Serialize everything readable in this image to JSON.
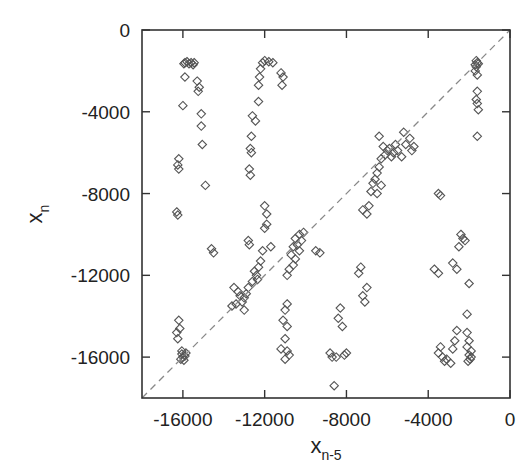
{
  "chart_data": {
    "type": "scatter",
    "title": "",
    "xlabel": "x",
    "xlabel_subscript": "n-5",
    "ylabel": "x",
    "ylabel_subscript": "n",
    "xlim": [
      -18000,
      0
    ],
    "ylim": [
      -18000,
      0
    ],
    "x_ticks": [
      -16000,
      -12000,
      -8000,
      -4000,
      0
    ],
    "x_tick_labels": [
      "-16000",
      "-12000",
      "-8000",
      "-4000",
      "0"
    ],
    "y_ticks": [
      0,
      -4000,
      -8000,
      -12000,
      -16000
    ],
    "y_tick_labels": [
      "0",
      "-4000",
      "-8000",
      "-12000",
      "-16000"
    ],
    "grid": false,
    "legend": null,
    "marker": "open-diamond",
    "reference_line": {
      "type": "diagonal",
      "style": "dashed",
      "from": [
        -18000,
        -18000
      ],
      "to": [
        0,
        0
      ]
    },
    "series": [
      {
        "name": "points",
        "points": [
          [
            -15900,
            -1600
          ],
          [
            -15800,
            -1550
          ],
          [
            -15700,
            -1650
          ],
          [
            -15600,
            -1600
          ],
          [
            -15500,
            -1700
          ],
          [
            -15950,
            -1650
          ],
          [
            -15450,
            -1600
          ],
          [
            -15900,
            -2300
          ],
          [
            -15300,
            -2500
          ],
          [
            -15200,
            -2800
          ],
          [
            -15250,
            -3000
          ],
          [
            -16000,
            -3700
          ],
          [
            -15100,
            -4100
          ],
          [
            -15100,
            -4700
          ],
          [
            -15050,
            -5600
          ],
          [
            -16200,
            -6300
          ],
          [
            -16250,
            -6600
          ],
          [
            -16200,
            -6800
          ],
          [
            -14900,
            -7600
          ],
          [
            -16300,
            -8900
          ],
          [
            -16250,
            -9050
          ],
          [
            -14600,
            -10700
          ],
          [
            -14500,
            -10900
          ],
          [
            -16200,
            -14200
          ],
          [
            -16150,
            -14600
          ],
          [
            -16300,
            -14800
          ],
          [
            -16250,
            -15100
          ],
          [
            -16050,
            -15850
          ],
          [
            -16000,
            -16000
          ],
          [
            -15900,
            -15950
          ],
          [
            -16100,
            -16100
          ],
          [
            -15950,
            -16150
          ],
          [
            -16050,
            -15700
          ],
          [
            -15850,
            -15800
          ],
          [
            -12100,
            -1600
          ],
          [
            -12000,
            -1500
          ],
          [
            -11800,
            -1550
          ],
          [
            -11600,
            -1600
          ],
          [
            -12200,
            -1900
          ],
          [
            -12250,
            -2300
          ],
          [
            -12300,
            -2700
          ],
          [
            -11200,
            -2100
          ],
          [
            -11100,
            -2300
          ],
          [
            -11150,
            -2700
          ],
          [
            -12300,
            -3500
          ],
          [
            -12600,
            -4200
          ],
          [
            -12450,
            -4450
          ],
          [
            -12650,
            -5200
          ],
          [
            -12700,
            -5800
          ],
          [
            -12650,
            -6000
          ],
          [
            -12750,
            -6800
          ],
          [
            -12700,
            -7100
          ],
          [
            -11900,
            -9500
          ],
          [
            -12000,
            -9700
          ],
          [
            -12800,
            -10300
          ],
          [
            -12750,
            -10500
          ],
          [
            -13500,
            -12600
          ],
          [
            -13300,
            -12800
          ],
          [
            -13200,
            -13000
          ],
          [
            -13000,
            -13100
          ],
          [
            -13100,
            -13300
          ],
          [
            -12900,
            -12900
          ],
          [
            -13400,
            -13400
          ],
          [
            -12800,
            -12600
          ],
          [
            -12600,
            -12300
          ],
          [
            -12400,
            -12000
          ],
          [
            -12300,
            -11600
          ],
          [
            -12500,
            -11800
          ],
          [
            -12200,
            -11300
          ],
          [
            -12100,
            -10800
          ],
          [
            -12350,
            -12200
          ],
          [
            -13600,
            -13500
          ],
          [
            -13000,
            -13700
          ],
          [
            -11700,
            -10600
          ],
          [
            -11900,
            -9000
          ],
          [
            -12000,
            -8600
          ],
          [
            -10500,
            -10200
          ],
          [
            -10300,
            -10000
          ],
          [
            -10200,
            -10300
          ],
          [
            -10400,
            -10500
          ],
          [
            -10100,
            -9900
          ],
          [
            -10600,
            -10600
          ],
          [
            -10700,
            -11000
          ],
          [
            -10500,
            -11200
          ],
          [
            -10800,
            -11700
          ],
          [
            -10900,
            -12000
          ],
          [
            -10600,
            -11500
          ],
          [
            -10300,
            -10800
          ],
          [
            -9500,
            -10800
          ],
          [
            -9300,
            -10900
          ],
          [
            -10900,
            -13400
          ],
          [
            -11000,
            -13700
          ],
          [
            -11100,
            -14200
          ],
          [
            -10900,
            -14500
          ],
          [
            -11000,
            -15100
          ],
          [
            -11200,
            -15600
          ],
          [
            -10800,
            -15900
          ],
          [
            -11000,
            -16100
          ],
          [
            -10900,
            -15700
          ],
          [
            -8300,
            -13600
          ],
          [
            -8400,
            -14100
          ],
          [
            -8200,
            -14500
          ],
          [
            -8800,
            -15800
          ],
          [
            -8500,
            -16000
          ],
          [
            -8100,
            -15900
          ],
          [
            -8700,
            -16000
          ],
          [
            -8000,
            -15800
          ],
          [
            -5900,
            -5800
          ],
          [
            -6000,
            -5900
          ],
          [
            -5700,
            -6000
          ],
          [
            -6100,
            -6100
          ],
          [
            -5800,
            -6200
          ],
          [
            -5600,
            -5600
          ],
          [
            -6200,
            -5700
          ],
          [
            -5500,
            -5900
          ],
          [
            -6300,
            -6300
          ],
          [
            -6400,
            -6700
          ],
          [
            -6500,
            -7000
          ],
          [
            -6600,
            -7300
          ],
          [
            -6700,
            -7500
          ],
          [
            -6300,
            -7600
          ],
          [
            -6800,
            -7900
          ],
          [
            -6500,
            -8000
          ],
          [
            -7200,
            -8800
          ],
          [
            -7000,
            -9000
          ],
          [
            -6900,
            -8600
          ],
          [
            -5200,
            -5000
          ],
          [
            -4900,
            -5300
          ],
          [
            -5100,
            -5600
          ],
          [
            -4800,
            -5900
          ],
          [
            -5300,
            -6200
          ],
          [
            -4700,
            -5700
          ],
          [
            -6400,
            -5200
          ],
          [
            -3500,
            -8000
          ],
          [
            -3400,
            -8100
          ],
          [
            -7300,
            -11600
          ],
          [
            -7400,
            -11900
          ],
          [
            -7000,
            -12600
          ],
          [
            -7200,
            -13000
          ],
          [
            -7100,
            -13300
          ],
          [
            -8600,
            -17400
          ],
          [
            -3700,
            -11700
          ],
          [
            -3500,
            -11900
          ],
          [
            -2800,
            -11400
          ],
          [
            -2600,
            -11700
          ],
          [
            -2400,
            -10000
          ],
          [
            -2300,
            -10200
          ],
          [
            -2200,
            -10300
          ],
          [
            -2500,
            -10600
          ],
          [
            -2000,
            -12400
          ],
          [
            -2100,
            -13900
          ],
          [
            -2600,
            -14700
          ],
          [
            -2700,
            -15200
          ],
          [
            -2800,
            -15600
          ],
          [
            -3400,
            -15500
          ],
          [
            -3500,
            -15800
          ],
          [
            -3300,
            -16000
          ],
          [
            -3100,
            -16100
          ],
          [
            -2900,
            -16300
          ],
          [
            -3200,
            -16200
          ],
          [
            -2100,
            -14800
          ],
          [
            -2000,
            -15200
          ],
          [
            -2100,
            -15500
          ],
          [
            -1900,
            -15700
          ],
          [
            -2000,
            -15900
          ],
          [
            -1950,
            -16100
          ],
          [
            -2050,
            -16200
          ],
          [
            -1900,
            -16000
          ],
          [
            -1650,
            -1500
          ],
          [
            -1600,
            -1600
          ],
          [
            -1700,
            -1700
          ],
          [
            -1650,
            -1800
          ],
          [
            -1550,
            -1650
          ],
          [
            -1700,
            -2000
          ],
          [
            -1600,
            -2200
          ],
          [
            -1600,
            -3000
          ],
          [
            -1650,
            -3400
          ],
          [
            -1600,
            -3600
          ],
          [
            -1550,
            -3900
          ],
          [
            -1600,
            -5200
          ]
        ]
      }
    ]
  }
}
